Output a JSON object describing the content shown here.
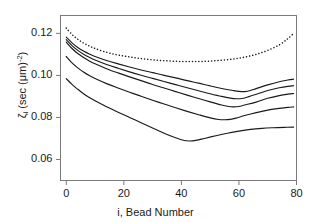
{
  "chart_data": {
    "type": "line",
    "title": "",
    "xlabel": "i, Bead Number",
    "ylabel_parts": {
      "symbol": "ζ",
      "subscript": "i",
      "units_open": " (sec (μm)",
      "exponent": "-2",
      "units_close": ")"
    },
    "ylabel": "ζi (sec (μm)-2)",
    "xlim": [
      -2,
      80
    ],
    "ylim": [
      0.05,
      0.1285
    ],
    "xticks": [
      0,
      20,
      40,
      60,
      80
    ],
    "xtick_labels": [
      "0",
      "20",
      "40",
      "60",
      "80"
    ],
    "yticks": [
      0.06,
      0.08,
      0.1,
      0.12
    ],
    "ytick_labels": [
      "0.06",
      "0.08",
      "0.10",
      "0.12"
    ],
    "grid": false,
    "legend": "none",
    "frame": "box",
    "line_color": "#1a1a1a",
    "series": [
      {
        "name": "curve-dotted-top",
        "style": "dotted",
        "x": [
          0,
          2,
          4,
          6,
          8,
          10,
          14,
          18,
          22,
          26,
          30,
          34,
          38,
          42,
          46,
          50,
          54,
          58,
          62,
          66,
          70,
          74,
          77,
          79
        ],
        "y": [
          0.1225,
          0.1195,
          0.1172,
          0.1154,
          0.114,
          0.1128,
          0.111,
          0.1097,
          0.1088,
          0.108,
          0.1074,
          0.107,
          0.1067,
          0.1066,
          0.1066,
          0.1068,
          0.1072,
          0.1078,
          0.1087,
          0.11,
          0.1119,
          0.1145,
          0.1175,
          0.12
        ]
      },
      {
        "name": "curve-solid-1",
        "style": "solid",
        "x": [
          0,
          2,
          4,
          6,
          8,
          10,
          14,
          18,
          22,
          26,
          30,
          34,
          38,
          42,
          46,
          50,
          54,
          58,
          60,
          62,
          64,
          66,
          70,
          74,
          77,
          79
        ],
        "y": [
          0.1182,
          0.1155,
          0.1133,
          0.1116,
          0.1102,
          0.109,
          0.1071,
          0.1055,
          0.104,
          0.1026,
          0.1013,
          0.1,
          0.0988,
          0.0975,
          0.0963,
          0.095,
          0.0938,
          0.0928,
          0.0924,
          0.0923,
          0.0928,
          0.0937,
          0.0955,
          0.097,
          0.0978,
          0.0982
        ]
      },
      {
        "name": "curve-solid-2",
        "style": "solid",
        "x": [
          0,
          2,
          4,
          6,
          8,
          10,
          14,
          18,
          22,
          26,
          30,
          34,
          38,
          42,
          46,
          50,
          54,
          57,
          59,
          61,
          63,
          66,
          70,
          74,
          77,
          79
        ],
        "y": [
          0.117,
          0.1142,
          0.1119,
          0.1101,
          0.1086,
          0.1073,
          0.1052,
          0.1034,
          0.1017,
          0.1001,
          0.0986,
          0.0971,
          0.0956,
          0.0941,
          0.0927,
          0.0913,
          0.09,
          0.0892,
          0.0889,
          0.089,
          0.0897,
          0.091,
          0.0928,
          0.0941,
          0.0948,
          0.0951
        ]
      },
      {
        "name": "curve-solid-3",
        "style": "solid",
        "x": [
          0,
          2,
          4,
          6,
          8,
          10,
          14,
          18,
          22,
          26,
          30,
          34,
          38,
          42,
          46,
          50,
          54,
          56,
          58,
          60,
          62,
          66,
          70,
          74,
          77,
          79
        ],
        "y": [
          0.1158,
          0.1128,
          0.1104,
          0.1085,
          0.1069,
          0.1055,
          0.1032,
          0.1012,
          0.0993,
          0.0975,
          0.0957,
          0.094,
          0.0923,
          0.0906,
          0.089,
          0.0874,
          0.0859,
          0.0853,
          0.085,
          0.0852,
          0.0859,
          0.0873,
          0.0891,
          0.0904,
          0.0911,
          0.0914
        ]
      },
      {
        "name": "curve-solid-4",
        "style": "solid",
        "x": [
          0,
          2,
          4,
          6,
          8,
          10,
          14,
          18,
          22,
          26,
          30,
          34,
          38,
          42,
          46,
          50,
          53,
          55,
          57,
          59,
          62,
          66,
          70,
          74,
          77,
          79
        ],
        "y": [
          0.109,
          0.106,
          0.1036,
          0.1016,
          0.0999,
          0.0985,
          0.0961,
          0.094,
          0.092,
          0.0901,
          0.0882,
          0.0864,
          0.0846,
          0.0829,
          0.0813,
          0.0798,
          0.079,
          0.0789,
          0.0791,
          0.0797,
          0.0809,
          0.0823,
          0.0835,
          0.0843,
          0.0848,
          0.085
        ]
      },
      {
        "name": "curve-solid-5",
        "style": "solid",
        "x": [
          0,
          2,
          4,
          6,
          8,
          10,
          14,
          18,
          22,
          26,
          30,
          34,
          38,
          41,
          43,
          45,
          48,
          52,
          56,
          60,
          64,
          68,
          72,
          76,
          79
        ],
        "y": [
          0.0985,
          0.0957,
          0.0934,
          0.0913,
          0.0895,
          0.0879,
          0.0851,
          0.0825,
          0.08,
          0.0775,
          0.075,
          0.0725,
          0.0703,
          0.069,
          0.0688,
          0.0691,
          0.07,
          0.0713,
          0.0725,
          0.0735,
          0.0743,
          0.0748,
          0.0751,
          0.0753,
          0.0754
        ]
      }
    ]
  },
  "axes": {
    "x_title": "i, Bead Number",
    "y_symbol": "ζ",
    "y_subscript": "i",
    "y_units_open": " (sec (μm)",
    "y_exponent": "-2",
    "y_units_close": ")"
  }
}
